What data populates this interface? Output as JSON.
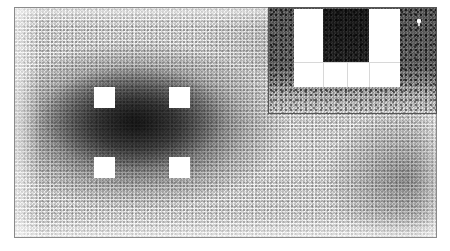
{
  "figure": {
    "width_px": 450,
    "height_px": 251,
    "background_color": "#ffffff",
    "point_color": "#000000",
    "render_style": "stipple-scatter"
  },
  "main_panel": {
    "name": "main-density-field",
    "x": 14,
    "y": 7,
    "width": 423,
    "height": 231,
    "border_color": "#8a8a8a",
    "description": "Dense black point-stipple field, darkest in a broad elliptical blob left of centre, fading toward the panel edges."
  },
  "masks": {
    "label": "white square masks",
    "count": 4,
    "fill": "#ffffff",
    "items": [
      {
        "name": "mask-top-left",
        "x": 79,
        "y": 79,
        "w": 21,
        "h": 21
      },
      {
        "name": "mask-top-right",
        "x": 154,
        "y": 79,
        "w": 21,
        "h": 21
      },
      {
        "name": "mask-bottom-left",
        "x": 79,
        "y": 149,
        "w": 21,
        "h": 21
      },
      {
        "name": "mask-bottom-right",
        "x": 154,
        "y": 149,
        "w": 21,
        "h": 21
      }
    ]
  },
  "inset_panel": {
    "name": "magnified-inset",
    "x": 268,
    "y": 7,
    "width": 169,
    "height": 107,
    "border_color": "#555555",
    "description": "Magnified crop of the same stipple field; the masked squares appear as enlarged white bands.",
    "bands": [
      {
        "name": "inset-band-left",
        "x": 25,
        "y": 1,
        "w": 29,
        "h": 78
      },
      {
        "name": "inset-band-right",
        "x": 100,
        "y": 1,
        "w": 31,
        "h": 78
      },
      {
        "name": "inset-band-bottom",
        "x": 25,
        "y": 54,
        "w": 106,
        "h": 25
      }
    ],
    "center_dark": {
      "name": "inset-center-dark-patch",
      "x": 54,
      "y": 1,
      "w": 46,
      "h": 53
    },
    "hairlines": [
      {
        "name": "inset-hairline-v1",
        "x": 54,
        "y": 54,
        "w": 1,
        "h": 25
      },
      {
        "name": "inset-hairline-v2",
        "x": 78,
        "y": 54,
        "w": 1,
        "h": 25
      },
      {
        "name": "inset-hairline-v3",
        "x": 100,
        "y": 54,
        "w": 1,
        "h": 25
      },
      {
        "name": "inset-hairline-h1",
        "x": 25,
        "y": 54,
        "w": 106,
        "h": 1
      }
    ]
  },
  "artifact": {
    "name": "cursor-speck",
    "description": "Small white speck / cursor remnant inside the inset, upper right",
    "x": 416,
    "y": 18,
    "w": 4,
    "h": 4,
    "color": "#ffffff"
  },
  "chart_data": {
    "type": "scatter",
    "xlabel": "",
    "ylabel": "",
    "grid": false,
    "legend": null,
    "xlim": [
      0,
      423
    ],
    "ylim": [
      0,
      231
    ],
    "point_color": "#000000",
    "density_peaks": [
      {
        "cx": 122,
        "cy": 118,
        "rx": 150,
        "ry": 85,
        "peak_opacity": 0.78
      },
      {
        "cx": 118,
        "cy": 110,
        "rx": 92,
        "ry": 52,
        "peak_opacity": 0.55
      },
      {
        "cx": 390,
        "cy": 170,
        "rx": 80,
        "ry": 70,
        "peak_opacity": 0.3
      },
      {
        "cx": 300,
        "cy": 40,
        "rx": 120,
        "ry": 60,
        "peak_opacity": 0.12
      }
    ],
    "masked_regions": [
      {
        "x": 65,
        "y": 72,
        "w": 21,
        "h": 21
      },
      {
        "x": 140,
        "y": 72,
        "w": 21,
        "h": 21
      },
      {
        "x": 65,
        "y": 142,
        "w": 21,
        "h": 21
      },
      {
        "x": 140,
        "y": 142,
        "w": 21,
        "h": 21
      }
    ],
    "annotations": [
      {
        "kind": "inset",
        "x": 254,
        "y": 0,
        "w": 169,
        "h": 107,
        "note": "magnified view"
      }
    ]
  }
}
